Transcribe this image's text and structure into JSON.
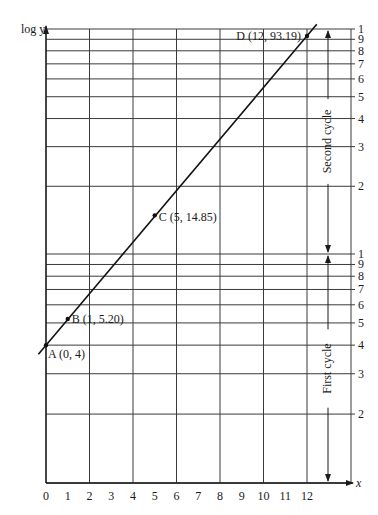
{
  "chart_data": {
    "type": "line",
    "title": "",
    "xlabel": "x",
    "ylabel": "log y",
    "yscale": "log",
    "xlim": [
      0,
      13
    ],
    "ylim": [
      1,
      100
    ],
    "grid": true,
    "x_ticks": [
      0,
      1,
      2,
      3,
      4,
      5,
      6,
      7,
      8,
      9,
      10,
      11,
      12
    ],
    "x_grid": [
      0,
      2,
      4,
      6,
      8,
      10,
      12
    ],
    "y_tick_labels_first_cycle": [
      "1",
      "2",
      "3",
      "4",
      "5",
      "6",
      "7",
      "8",
      "9"
    ],
    "y_tick_labels_second_cycle": [
      "1",
      "2",
      "3",
      "4",
      "5",
      "6",
      "7",
      "8",
      "9",
      "1"
    ],
    "y_grid_values": [
      1,
      2,
      3,
      4,
      5,
      6,
      7,
      8,
      9,
      10,
      20,
      30,
      40,
      50,
      60,
      70,
      80,
      90,
      100
    ],
    "series": [
      {
        "name": "y = 4(1.3)^x",
        "x": [
          0,
          1,
          5,
          12
        ],
        "y": [
          4,
          5.2,
          14.85,
          93.19
        ]
      }
    ],
    "points": [
      {
        "label": "A (0, 4)",
        "x": 0,
        "y": 4
      },
      {
        "label": "B (1, 5.20)",
        "x": 1,
        "y": 5.2
      },
      {
        "label": "C (5, 14.85)",
        "x": 5,
        "y": 14.85
      },
      {
        "label": "D (12, 93.19)",
        "x": 12,
        "y": 93.19
      }
    ],
    "annotations": [
      {
        "text": "First cycle",
        "range": [
          1,
          10
        ]
      },
      {
        "text": "Second cycle",
        "range": [
          10,
          100
        ]
      }
    ]
  },
  "labels": {
    "ylabel": "log y",
    "xlabel": "x",
    "first_cycle": "First cycle",
    "second_cycle": "Second cycle"
  }
}
